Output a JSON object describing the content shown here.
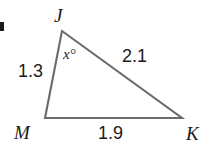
{
  "figure": {
    "type": "triangle-diagram",
    "background_color": "#ffffff",
    "stroke_color": "#6b6b6b",
    "text_color": "#1a1a1a",
    "width": 203,
    "height": 151
  },
  "vertices": {
    "j": {
      "label": "J",
      "x": 62,
      "y": 31
    },
    "m": {
      "label": "M",
      "x": 45,
      "y": 118
    },
    "k": {
      "label": "K",
      "x": 182,
      "y": 118
    }
  },
  "sides": {
    "jm": {
      "label": "1.3",
      "value": 1.3,
      "from": "J",
      "to": "M"
    },
    "jk": {
      "label": "2.1",
      "value": 2.1,
      "from": "J",
      "to": "K"
    },
    "mk": {
      "label": "1.9",
      "value": 1.9,
      "from": "M",
      "to": "K"
    }
  },
  "angles": {
    "at_j": {
      "label": "x°",
      "variable": "x",
      "unit": "degrees",
      "at_vertex": "J"
    }
  },
  "marks": {
    "left_edge_artifact": "small-dark-rectangle"
  }
}
